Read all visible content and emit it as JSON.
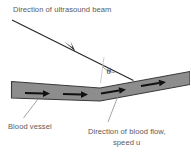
{
  "figure": {
    "type": "diagram",
    "background_color": "#ffffff"
  },
  "labels": {
    "beam": "Direction of ultrasound beam",
    "vessel": "Blood vessel",
    "flow_line1": "Direction of blood flow,",
    "flow_line2": "speed u",
    "angle_symbol": "θ"
  },
  "colors": {
    "vessel_fill": "#8d8d8d",
    "vessel_outline": "#3a3a3a",
    "beam": "#2b2b2b",
    "leader": "#8c8c8c",
    "text": "#5a5a5a",
    "arrow": "#111111"
  },
  "geometry": {
    "beam_start": "12,20",
    "beam_end": "133,80",
    "vessel_left_top": "11,81",
    "vessel_right_top": "190,72",
    "flow_arrow_count": 4
  }
}
